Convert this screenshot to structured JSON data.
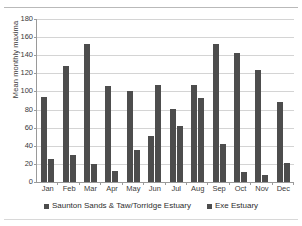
{
  "chart_data": {
    "type": "bar",
    "title": "",
    "xlabel": "",
    "ylabel": "Mean monthly maxima",
    "ylim": [
      0,
      180
    ],
    "yticks": [
      0,
      20,
      40,
      60,
      80,
      100,
      120,
      140,
      160,
      180
    ],
    "grid": true,
    "legend_position": "bottom",
    "categories": [
      "Jan",
      "Feb",
      "Mar",
      "Apr",
      "May",
      "Jun",
      "Jul",
      "Aug",
      "Sep",
      "Oct",
      "Nov",
      "Dec"
    ],
    "series": [
      {
        "name": "Saunton Sands & Taw/Torridge Estuary",
        "color": "#4d4d4d",
        "values": [
          94,
          128,
          152,
          106,
          100,
          51,
          81,
          107,
          152,
          143,
          124,
          88
        ]
      },
      {
        "name": "Exe Estuary",
        "color": "#4d4d4d",
        "values": [
          25,
          30,
          20,
          12,
          35,
          107,
          62,
          93,
          42,
          11,
          8,
          21
        ]
      }
    ]
  },
  "legend": {
    "items": [
      {
        "label": "Saunton Sands & Taw/Torridge Estuary"
      },
      {
        "label": "Exe Estuary"
      }
    ]
  }
}
